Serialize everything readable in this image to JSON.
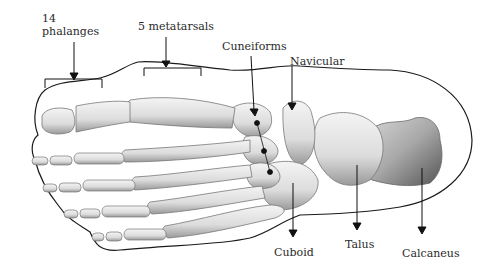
{
  "diagram": {
    "labels": {
      "phalanges": "14\nphalanges",
      "metatarsals": "5 metatarsals",
      "cuneiforms": "Cuneiforms",
      "navicular": "Navicular",
      "cuboid": "Cuboid",
      "talus": "Talus",
      "calcaneus": "Calcaneus"
    },
    "colors": {
      "outline": "#1a1a1a",
      "bone_light": "#f2f2f2",
      "bone_mid": "#c8c8c8",
      "bone_dark": "#6e6e6e",
      "arrow": "#111111",
      "label_text": "#2a2a2a"
    }
  }
}
